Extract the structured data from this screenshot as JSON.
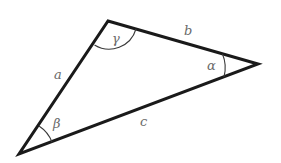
{
  "diagram": {
    "title": "",
    "type": "triangle",
    "vertices": [
      {
        "id": "top",
        "x": 108,
        "y": 21,
        "angle_label": "γ"
      },
      {
        "id": "right",
        "x": 258,
        "y": 64,
        "angle_label": "α"
      },
      {
        "id": "bottom-left",
        "x": 19,
        "y": 154,
        "angle_label": "β"
      }
    ],
    "sides": [
      {
        "label": "a",
        "from": "bottom-left",
        "to": "top"
      },
      {
        "label": "b",
        "from": "top",
        "to": "right"
      },
      {
        "label": "c",
        "from": "bottom-left",
        "to": "right"
      }
    ],
    "labels": {
      "side_a": "a",
      "side_b": "b",
      "side_c": "c",
      "angle_alpha": "α",
      "angle_beta": "β",
      "angle_gamma": "γ"
    },
    "colors": {
      "stroke": "#1a1a1a",
      "label": "#6a6a6a",
      "background": "#ffffff"
    }
  }
}
